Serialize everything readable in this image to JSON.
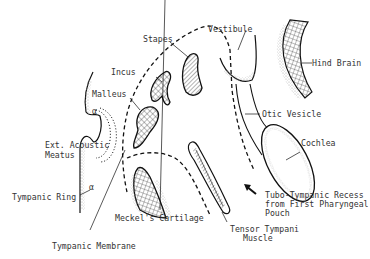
{
  "diagram": {
    "type": "anatomical-illustration",
    "labels": {
      "stapes": "Stapes",
      "vestibule": "Vestibule",
      "hind_brain": "Hind Brain",
      "incus": "Incus",
      "malleus": "Malleus",
      "otic_vesicle": "Otic Vesicle",
      "ext_acoustic_meatus_1": "Ext. Acoustic",
      "ext_acoustic_meatus_2": "Meatus",
      "cochlea": "Cochlea",
      "tympanic_ring": "Tympanic Ring",
      "tubo_recess_1": "Tubo-Tympanic Recess",
      "tubo_recess_2": "from First Pharyngeal",
      "tubo_recess_3": "Pouch",
      "meckels_cartilage": "Meckel's Cartilage",
      "tensor_tympani_1": "Tensor Tympani",
      "tensor_tympani_2": "Muscle",
      "tympanic_membrane": "Tympanic Membrane"
    },
    "colors": {
      "line": "#1a1a1a",
      "text": "#333333",
      "stipple": "#b0b0b0",
      "background": "#ffffff"
    }
  }
}
